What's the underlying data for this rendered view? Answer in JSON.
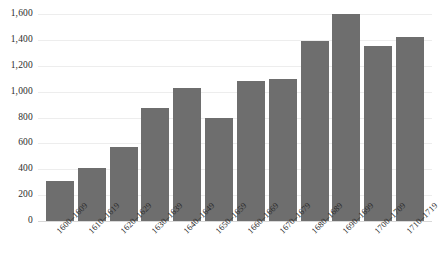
{
  "chart_data": {
    "type": "bar",
    "title": "",
    "subtitle": "",
    "xlabel": "",
    "ylabel": "",
    "categories": [
      "1600–1609",
      "1610–1619",
      "1620–1629",
      "1630–1639",
      "1640–1649",
      "1650–1659",
      "1660–1669",
      "1670–1679",
      "1680–1689",
      "1690–1699",
      "1700–1709",
      "1710–1719"
    ],
    "values": [
      310,
      410,
      570,
      870,
      1030,
      795,
      1080,
      1100,
      1390,
      1600,
      1355,
      1420
    ],
    "ylim": [
      0,
      1600
    ],
    "ytick_values": [
      0,
      200,
      400,
      600,
      800,
      1000,
      1200,
      1400,
      1600
    ],
    "ytick_labels": [
      "0",
      "200",
      "400",
      "600",
      "800",
      "1,000",
      "1,200",
      "1,400",
      "1,600"
    ],
    "grid": true,
    "legend": false,
    "legend_position": "none",
    "bar_color": "#6e6e6e",
    "gridline_color": "#ededed",
    "background_color": "#ffffff",
    "xtick_rotation": -45
  }
}
